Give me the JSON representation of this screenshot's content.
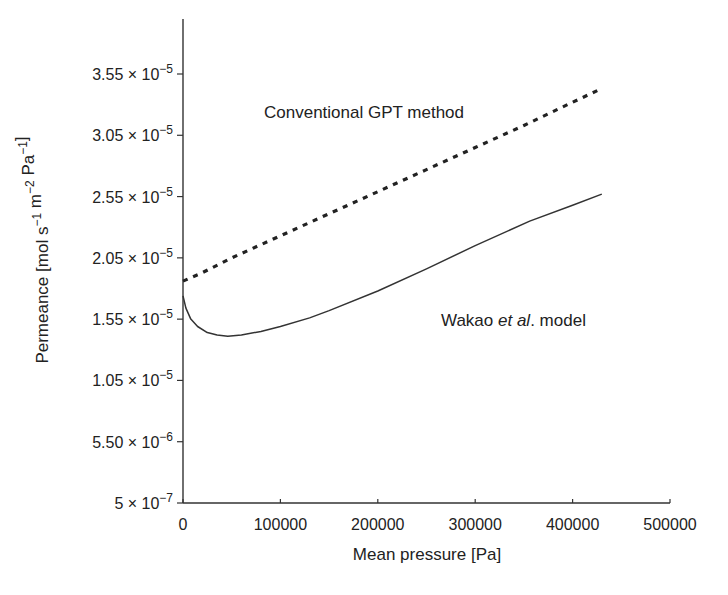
{
  "chart_data": {
    "type": "line",
    "title": "",
    "xlabel": "Mean pressure [Pa]",
    "ylabel": "Permeance [mol s⁻¹ m⁻² Pa⁻¹]",
    "ylabel_parts": {
      "prefix": "Permeance [mol s",
      "sup1": "−1",
      "mid1": " m",
      "sup2": "−2",
      "mid2": " Pa",
      "sup3": "−1",
      "suffix": "]"
    },
    "xlim": [
      0,
      500000
    ],
    "ylim": [
      5e-07,
      3.55e-05
    ],
    "grid": false,
    "legend": "inline annotations",
    "x_ticks": [
      {
        "value": 0,
        "label": "0"
      },
      {
        "value": 100000,
        "label": "100000"
      },
      {
        "value": 200000,
        "label": "200000"
      },
      {
        "value": 300000,
        "label": "300000"
      },
      {
        "value": 400000,
        "label": "400000"
      },
      {
        "value": 500000,
        "label": "500000"
      }
    ],
    "y_ticks": [
      {
        "value": 5e-07,
        "mant": "5",
        "exp": "−7"
      },
      {
        "value": 5.5e-06,
        "mant": "5.50",
        "exp": "−6"
      },
      {
        "value": 1.05e-05,
        "mant": "1.05",
        "exp": "−5"
      },
      {
        "value": 1.55e-05,
        "mant": "1.55",
        "exp": "−5"
      },
      {
        "value": 2.05e-05,
        "mant": "2.05",
        "exp": "−5"
      },
      {
        "value": 2.55e-05,
        "mant": "2.55",
        "exp": "−5"
      },
      {
        "value": 3.05e-05,
        "mant": "3.05",
        "exp": "−5"
      },
      {
        "value": 3.55e-05,
        "mant": "3.55",
        "exp": "−5"
      }
    ],
    "series": [
      {
        "name": "Conventional GPT method",
        "style": "dashed",
        "color": "#222222",
        "x": [
          0,
          20000,
          50000,
          100000,
          150000,
          200000,
          250000,
          300000,
          350000,
          400000,
          427000
        ],
        "values": [
          1.86e-05,
          1.93e-05,
          2.05e-05,
          2.23e-05,
          2.41e-05,
          2.59e-05,
          2.77e-05,
          2.95e-05,
          3.13e-05,
          3.32e-05,
          3.42e-05
        ]
      },
      {
        "name": "Wakao et al. model",
        "style": "solid",
        "color": "#333333",
        "x": [
          0,
          3000,
          8000,
          15000,
          25000,
          35000,
          46000,
          60000,
          80000,
          100000,
          130000,
          150000,
          200000,
          250000,
          300000,
          356000,
          400000,
          430000
        ],
        "values": [
          1.74e-05,
          1.64e-05,
          1.55e-05,
          1.49e-05,
          1.44e-05,
          1.42e-05,
          1.41e-05,
          1.42e-05,
          1.45e-05,
          1.49e-05,
          1.56e-05,
          1.62e-05,
          1.78e-05,
          1.96e-05,
          2.15e-05,
          2.35e-05,
          2.48e-05,
          2.57e-05
        ]
      }
    ],
    "annotations": [
      {
        "text": "Conventional GPT method",
        "x": 264,
        "y": 118,
        "series": "Conventional GPT method"
      },
      {
        "text_pre": "Wakao ",
        "text_italic": "et al",
        "text_post": ". model",
        "x": 441,
        "y": 326,
        "series": "Wakao et al. model"
      }
    ],
    "plot_area_px": {
      "x0": 183,
      "x1": 670,
      "y_top": 19,
      "y_bottom": 503
    }
  }
}
